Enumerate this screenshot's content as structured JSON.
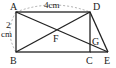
{
  "diagram": {
    "points": {
      "A": {
        "label": "A",
        "x": 16,
        "y": 12
      },
      "B": {
        "label": "B",
        "x": 16,
        "y": 52
      },
      "C": {
        "label": "C",
        "x": 90,
        "y": 52
      },
      "D": {
        "label": "D",
        "x": 90,
        "y": 12
      },
      "E": {
        "label": "E",
        "x": 108,
        "y": 52
      },
      "F": {
        "label": "F",
        "x": 53,
        "y": 32
      },
      "G": {
        "label": "G",
        "x": 90,
        "y": 45
      }
    },
    "measurements": {
      "top": "4cm",
      "left_num": "2",
      "left_unit": "cm"
    },
    "colors": {
      "line": "#222222",
      "dashed": "#999999"
    }
  }
}
